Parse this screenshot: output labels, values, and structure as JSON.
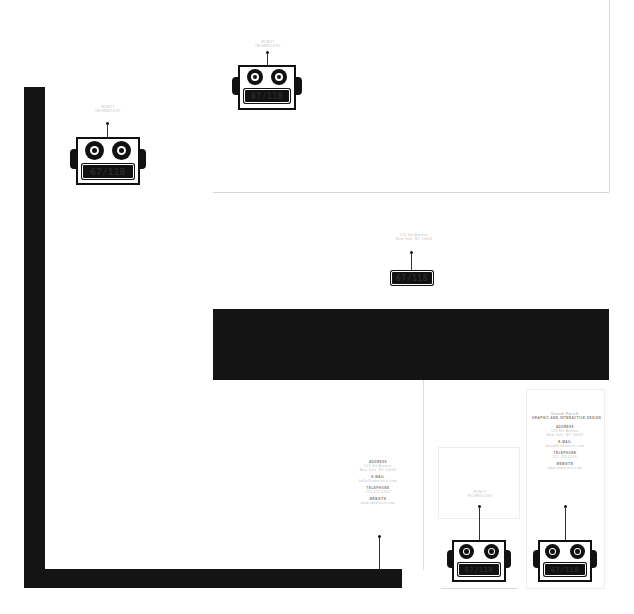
{
  "brand": {
    "name": "Robot Stationery Mockup",
    "display_text": "67/11B",
    "colors": {
      "ink": "#141414",
      "paper": "#ffffff",
      "muted_text": "#b8b8b8",
      "fold_line": "#d8d8d8"
    }
  },
  "items": {
    "envelope": {
      "logo_arc_lines": [
        "ROBOT",
        "TECHNOLOGY"
      ]
    },
    "large_card": {
      "logo_arc_lines": [
        "ROBOT",
        "TECHNOLOGY"
      ]
    },
    "letterhead_top": {
      "address_arc_lines": [
        "123 4th Avenue",
        "New York, NY 10003"
      ]
    },
    "letter_panel": {
      "contact_blocks": [
        {
          "heading": "ADDRESS",
          "lines": [
            "123 4th Avenue",
            "New York, NY 10003"
          ]
        },
        {
          "heading": "E-MAIL",
          "lines": [
            "hello@robottech.com"
          ]
        },
        {
          "heading": "TELEPHONE",
          "lines": [
            "212.555.0100"
          ]
        },
        {
          "heading": "WEBSITE",
          "lines": [
            "www.robottech.com"
          ]
        }
      ]
    },
    "business_card_front": {
      "arc_lines": [
        "ROBOT",
        "TECHNOLOGY"
      ]
    },
    "business_card_back": {
      "name": "David Porch",
      "title": "GRAPHIC AND INTERACTIVE DESIGN",
      "contact_blocks": [
        {
          "heading": "ADDRESS",
          "lines": [
            "123 4th Avenue",
            "New York, NY 10003"
          ]
        },
        {
          "heading": "E-MAIL",
          "lines": [
            "david@robottech.com"
          ]
        },
        {
          "heading": "TELEPHONE",
          "lines": [
            "212.555.0100"
          ]
        },
        {
          "heading": "WEBSITE",
          "lines": [
            "www.robottech.com"
          ]
        }
      ]
    }
  }
}
